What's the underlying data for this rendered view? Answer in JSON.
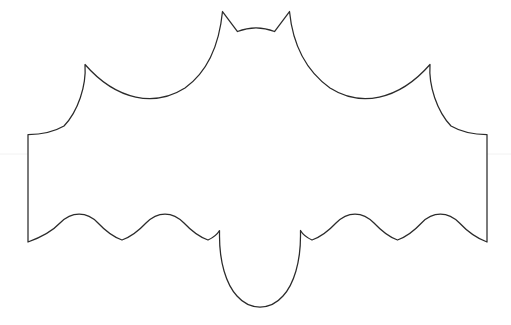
{
  "page": {
    "title": "Bat Outline Template",
    "kind": "line-art-drawing",
    "width": 511,
    "height": 325
  },
  "canvas": {
    "background_color": "#ffffff",
    "stroke_color": "#2b2b2b",
    "fill_color": "#ffffff",
    "stroke_width": 1.25
  },
  "guides": {
    "horizontal_rule": {
      "visible": true,
      "color": "#f2f2f2",
      "y": 154,
      "x_start": 0,
      "x_end": 511
    }
  },
  "shape": {
    "name": "bat",
    "description": "Outlined bat silhouette with two pointed ears, swept wings with pointed shoulder peaks, vertical wing-tip edges, three scalloped arcs along each lower wing edge, and a rounded central body lobe.",
    "path": "M 222.5 11.5 L 237.5 31.5 C 250 26.5 262 26.5 274.5 31.5 L 289.5 11.5 C 292.5 42 305 70 330 88 C 360 107 398 101 430 64.5 C 428.5 86 437 111 451 126 C 463 133 477 134.5 487 134.5 L 487 242 C 476 238 467 231 459.5 223 C 448 211.5 433 211 421.5 223 C 414 231 406 237 397.5 240 C 389 237 381.5 231 374 223 C 362.5 211 347.5 211 336 223 C 328.5 231 320.5 237 312 240 C 306.5 237.5 302.5 234 300.5 230.5 L 300.5 236 C 300.5 262 294 284 283 296 C 276 304 268 307 260 307 C 252 307 244 304 237 296 C 226 284 219.5 262 219.5 236 L 219.5 230.5 C 217.5 234 213.5 237.5 208 240 C 199.5 237 191.5 231 184 223 C 172.5 211 157.5 211 146 223 C 138.5 231 130.5 237 122 240 C 113.5 237 105.5 231 98 223 C 86.5 211 71.5 211.5 60 223 C 52.5 231 39 238 28 242 L 28 134.5 C 38 134.5 52 133 64 126 C 78 111 86.5 86 85 64.5 C 117 101 155 107 185 88 C 210 70 219.5 42 222.5 11.5 Z",
    "anchors": {
      "left_ear_tip": [
        222.5,
        11.5
      ],
      "right_ear_tip": [
        289.5,
        11.5
      ],
      "head_dip_center": [
        256,
        28
      ],
      "left_shoulder_peak": [
        85,
        64.5
      ],
      "right_shoulder_peak": [
        430,
        64.5
      ],
      "left_wing_edge_top": [
        28,
        134.5
      ],
      "left_wing_edge_bottom": [
        28,
        242
      ],
      "right_wing_edge_top": [
        487,
        134.5
      ],
      "right_wing_edge_bottom": [
        487,
        242
      ],
      "body_lobe_bottom": [
        260,
        307
      ],
      "left_scallop_valleys": [
        [
          85,
          238
        ],
        [
          157,
          238
        ]
      ],
      "right_scallop_valleys": [
        [
          355,
          238
        ],
        [
          426,
          238
        ]
      ]
    }
  }
}
